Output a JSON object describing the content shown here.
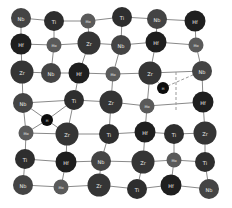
{
  "diagram": {
    "type": "atomic-lattice",
    "elements": {
      "Ti": {
        "radius": 10,
        "color": "#2e2e2e"
      },
      "Zr": {
        "radius": 11.5,
        "color": "#353535"
      },
      "Hf": {
        "radius": 10.5,
        "color": "#1f1f1f"
      },
      "Nb": {
        "radius": 10,
        "color": "#444444"
      },
      "Mo": {
        "radius": 7.5,
        "color": "#5a5a5a"
      },
      "H": {
        "radius": 6,
        "color": "#0d0d0d"
      }
    },
    "atoms": [
      {
        "id": 0,
        "el": "Nb",
        "x": 21,
        "y": 18
      },
      {
        "id": 1,
        "el": "Ti",
        "x": 54,
        "y": 21
      },
      {
        "id": 2,
        "el": "Mo",
        "x": 88,
        "y": 21
      },
      {
        "id": 3,
        "el": "Ti",
        "x": 122,
        "y": 17
      },
      {
        "id": 4,
        "el": "Nb",
        "x": 157,
        "y": 19
      },
      {
        "id": 5,
        "el": "Hf",
        "x": 195,
        "y": 21
      },
      {
        "id": 6,
        "el": "Hf",
        "x": 21,
        "y": 44
      },
      {
        "id": 7,
        "el": "Mo",
        "x": 54,
        "y": 45
      },
      {
        "id": 8,
        "el": "Zr",
        "x": 89,
        "y": 43
      },
      {
        "id": 9,
        "el": "Nb",
        "x": 121,
        "y": 45
      },
      {
        "id": 10,
        "el": "Hf",
        "x": 156,
        "y": 42
      },
      {
        "id": 11,
        "el": "Mo",
        "x": 196,
        "y": 45
      },
      {
        "id": 12,
        "el": "Zr",
        "x": 22,
        "y": 72
      },
      {
        "id": 13,
        "el": "Nb",
        "x": 51,
        "y": 73
      },
      {
        "id": 14,
        "el": "Hf",
        "x": 79,
        "y": 73
      },
      {
        "id": 15,
        "el": "Mo",
        "x": 113,
        "y": 74
      },
      {
        "id": 16,
        "el": "Zr",
        "x": 150,
        "y": 73
      },
      {
        "id": 17,
        "el": "Nb",
        "x": 202,
        "y": 71
      },
      {
        "id": 18,
        "el": "Nb",
        "x": 23,
        "y": 103
      },
      {
        "id": 19,
        "el": "Ti",
        "x": 74,
        "y": 100
      },
      {
        "id": 20,
        "el": "Zr",
        "x": 111,
        "y": 102
      },
      {
        "id": 21,
        "el": "Mo",
        "x": 147,
        "y": 106
      },
      {
        "id": 22,
        "el": "Hf",
        "x": 203,
        "y": 102
      },
      {
        "id": 23,
        "el": "Mo",
        "x": 26,
        "y": 133
      },
      {
        "id": 24,
        "el": "Zr",
        "x": 67,
        "y": 134
      },
      {
        "id": 25,
        "el": "Ti",
        "x": 109,
        "y": 134
      },
      {
        "id": 26,
        "el": "Hf",
        "x": 145,
        "y": 132
      },
      {
        "id": 27,
        "el": "Ti",
        "x": 174,
        "y": 134
      },
      {
        "id": 28,
        "el": "Zr",
        "x": 205,
        "y": 133
      },
      {
        "id": 29,
        "el": "Ti",
        "x": 25,
        "y": 159
      },
      {
        "id": 30,
        "el": "Hf",
        "x": 66,
        "y": 162
      },
      {
        "id": 31,
        "el": "Nb",
        "x": 101,
        "y": 161
      },
      {
        "id": 32,
        "el": "Zr",
        "x": 143,
        "y": 162
      },
      {
        "id": 33,
        "el": "Mo",
        "x": 174,
        "y": 160
      },
      {
        "id": 34,
        "el": "Ti",
        "x": 205,
        "y": 162
      },
      {
        "id": 35,
        "el": "Nb",
        "x": 23,
        "y": 185
      },
      {
        "id": 36,
        "el": "Mo",
        "x": 61,
        "y": 187
      },
      {
        "id": 37,
        "el": "Zr",
        "x": 99,
        "y": 185
      },
      {
        "id": 38,
        "el": "Ti",
        "x": 137,
        "y": 189
      },
      {
        "id": 39,
        "el": "Hf",
        "x": 171,
        "y": 185
      },
      {
        "id": 40,
        "el": "Nb",
        "x": 209,
        "y": 189
      },
      {
        "id": 41,
        "el": "H",
        "x": 47,
        "y": 120
      },
      {
        "id": 42,
        "el": "H",
        "x": 163,
        "y": 88
      }
    ],
    "bonds": [
      [
        0,
        1
      ],
      [
        1,
        2
      ],
      [
        2,
        3
      ],
      [
        3,
        4
      ],
      [
        4,
        5
      ],
      [
        6,
        7
      ],
      [
        7,
        8
      ],
      [
        8,
        9
      ],
      [
        9,
        10
      ],
      [
        10,
        11
      ],
      [
        0,
        6
      ],
      [
        1,
        7
      ],
      [
        2,
        8
      ],
      [
        3,
        9
      ],
      [
        4,
        10
      ],
      [
        5,
        11
      ],
      [
        12,
        13
      ],
      [
        13,
        14
      ],
      [
        14,
        15
      ],
      [
        15,
        16
      ],
      [
        16,
        17
      ],
      [
        6,
        12
      ],
      [
        7,
        13
      ],
      [
        8,
        14
      ],
      [
        9,
        15
      ],
      [
        10,
        16
      ],
      [
        11,
        17
      ],
      [
        18,
        19
      ],
      [
        19,
        20
      ],
      [
        20,
        21
      ],
      [
        21,
        22
      ],
      [
        12,
        18
      ],
      [
        14,
        19
      ],
      [
        15,
        20
      ],
      [
        16,
        21
      ],
      [
        17,
        22
      ],
      [
        23,
        24
      ],
      [
        24,
        25
      ],
      [
        25,
        26
      ],
      [
        26,
        27
      ],
      [
        27,
        28
      ],
      [
        18,
        23
      ],
      [
        19,
        24
      ],
      [
        20,
        25
      ],
      [
        21,
        26
      ],
      [
        22,
        28
      ],
      [
        29,
        30
      ],
      [
        30,
        31
      ],
      [
        31,
        32
      ],
      [
        32,
        33
      ],
      [
        33,
        34
      ],
      [
        23,
        29
      ],
      [
        24,
        30
      ],
      [
        25,
        31
      ],
      [
        26,
        32
      ],
      [
        27,
        33
      ],
      [
        28,
        34
      ],
      [
        35,
        36
      ],
      [
        36,
        37
      ],
      [
        37,
        38
      ],
      [
        38,
        39
      ],
      [
        39,
        40
      ],
      [
        29,
        35
      ],
      [
        30,
        36
      ],
      [
        31,
        37
      ],
      [
        32,
        38
      ],
      [
        33,
        39
      ],
      [
        34,
        40
      ],
      [
        41,
        18
      ],
      [
        41,
        19
      ],
      [
        41,
        23
      ],
      [
        41,
        24
      ]
    ],
    "dashed_bonds": [
      [
        42,
        17
      ],
      [
        16,
        42
      ]
    ],
    "dashed_box": {
      "x1": 176,
      "y1": 72,
      "x2": 176,
      "y2": 112
    },
    "bond_color": "#8a8a8a",
    "dashed_color": "#999999"
  }
}
